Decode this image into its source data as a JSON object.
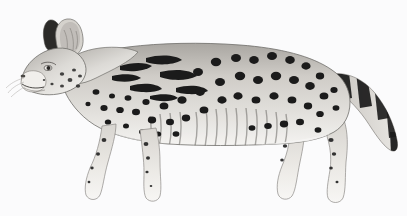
{
  "image": {
    "kind": "natural-history-illustration",
    "medium": "grayscale-pencil-drawing",
    "background_color": "#fbfbfc",
    "width": 407,
    "height": 216
  },
  "caption": {
    "text": "serval",
    "color": "#1d1d1f",
    "align": "center",
    "position": "above-subject"
  },
  "subject": {
    "common_name": "serval",
    "type": "wild-cat",
    "view": "full-body-profile",
    "facing": "left",
    "pose": "standing-walking",
    "palette": {
      "fur_light": "#e6e4e0",
      "fur_mid": "#b6b3ae",
      "fur_shadow": "#8b8884",
      "markings": "#1b1b1b",
      "outline": "#6f6d69",
      "belly": "#f2f1ee"
    },
    "parts": {
      "head": {
        "label": "head",
        "features": "small head, long neck"
      },
      "ears": {
        "label": "ears",
        "features": "very large, rounded, dark rear with pale band"
      },
      "muzzle": {
        "label": "muzzle",
        "features": "pale with dark whisker spots"
      },
      "eye": {
        "label": "eye",
        "features": "dark, forward-facing"
      },
      "neck": {
        "label": "neck",
        "features": "long, with elongated dark streaks"
      },
      "shoulder": {
        "label": "shoulder",
        "features": "elongated blotches and bars"
      },
      "torso": {
        "label": "torso",
        "features": "bold round black spots over pale tawny coat"
      },
      "flank": {
        "label": "flank",
        "features": "vertical striations on lower ribs"
      },
      "belly": {
        "label": "belly",
        "features": "pale, near white"
      },
      "forelegs": {
        "label": "forelegs",
        "features": "long, pale, small dark spots"
      },
      "hindlegs": {
        "label": "hindlegs",
        "features": "long, angled hock, spotted"
      },
      "paws": {
        "label": "paws",
        "features": "pale, unmarked"
      },
      "tail": {
        "label": "tail",
        "features": "short, with black rings and pale bands, dark tip"
      }
    },
    "markings": {
      "pattern": "spots-and-bars",
      "spot_color": "#1b1b1b",
      "tail_rings": 6
    }
  }
}
